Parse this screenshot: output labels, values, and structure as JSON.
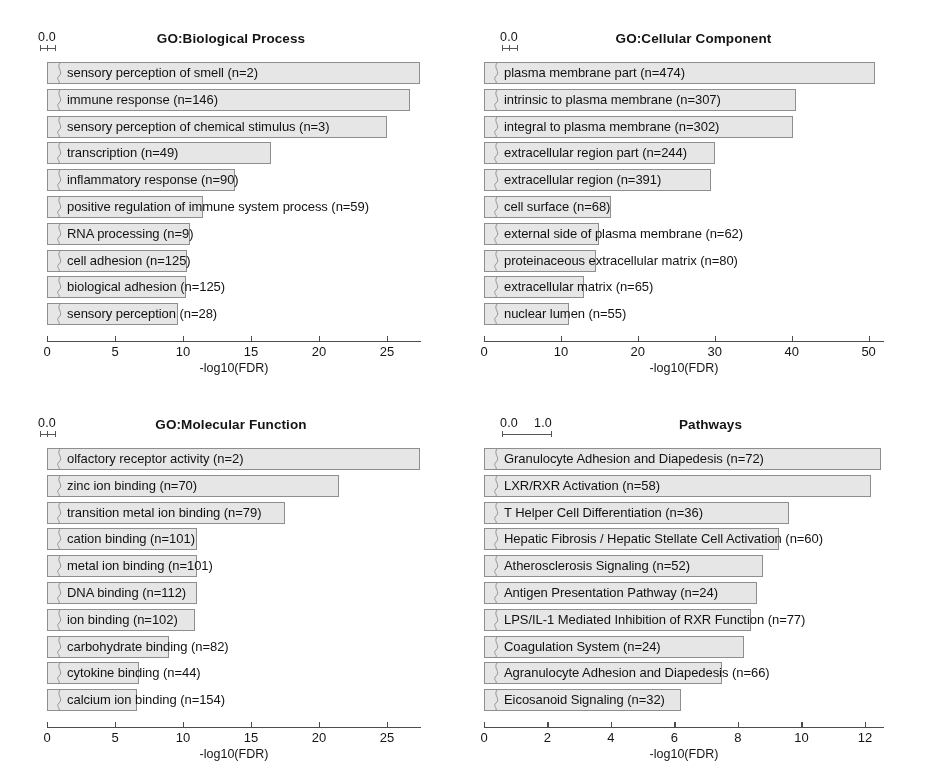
{
  "figure": {
    "background": "#ffffff",
    "bar_fill": "#e9e9e9",
    "bar_stroke": "#8e8e8e",
    "axis_color": "#4a4a4a"
  },
  "panels": [
    {
      "id": "go-biological-process",
      "title": "GO:Biological Process",
      "mini_scale": {
        "labels": [
          "0.0"
        ],
        "values": [
          0.0
        ]
      },
      "chart_data": {
        "type": "bar",
        "title": "GO:Biological Process",
        "xlabel": "-log10(FDR)",
        "ylabel": "",
        "orientation": "horizontal",
        "xlim": [
          0,
          27.5
        ],
        "ticks": [
          0,
          5,
          10,
          15,
          20,
          25
        ],
        "tick_labels": [
          "0",
          "5",
          "10",
          "15",
          "20",
          "25"
        ],
        "grid": false,
        "legend": "none",
        "categories": [
          "sensory perception of smell (n=2)",
          "immune response (n=146)",
          "sensory perception of chemical stimulus (n=3)",
          "transcription (n=49)",
          "inflammatory response (n=90)",
          "positive regulation of immune system process (n=59)",
          "RNA processing (n=9)",
          "cell adhesion (n=125)",
          "biological adhesion (n=125)",
          "sensory perception (n=28)"
        ],
        "values": [
          27.4,
          26.7,
          25.0,
          16.5,
          13.8,
          11.5,
          10.5,
          10.3,
          10.2,
          9.6
        ]
      }
    },
    {
      "id": "go-cellular-component",
      "title": "GO:Cellular Component",
      "mini_scale": {
        "labels": [
          "0.0"
        ],
        "values": [
          0.0
        ]
      },
      "chart_data": {
        "type": "bar",
        "title": "GO:Cellular Component",
        "xlabel": "-log10(FDR)",
        "ylabel": "",
        "orientation": "horizontal",
        "xlim": [
          0,
          52
        ],
        "ticks": [
          0,
          10,
          20,
          30,
          40,
          50
        ],
        "tick_labels": [
          "0",
          "10",
          "20",
          "30",
          "40",
          "50"
        ],
        "grid": false,
        "legend": "none",
        "categories": [
          "plasma membrane part (n=474)",
          "intrinsic to plasma membrane (n=307)",
          "integral to plasma membrane (n=302)",
          "extracellular region part (n=244)",
          "extracellular region (n=391)",
          "cell surface (n=68)",
          "external side of plasma membrane (n=62)",
          "proteinaceous extracellular matrix (n=80)",
          "extracellular matrix (n=65)",
          "nuclear lumen (n=55)"
        ],
        "values": [
          50.8,
          40.5,
          40.2,
          30.0,
          29.5,
          16.5,
          15.0,
          14.5,
          13.0,
          11.0
        ]
      }
    },
    {
      "id": "go-molecular-function",
      "title": "GO:Molecular Function",
      "mini_scale": {
        "labels": [
          "0.0"
        ],
        "values": [
          0.0
        ]
      },
      "chart_data": {
        "type": "bar",
        "title": "GO:Molecular Function",
        "xlabel": "-log10(FDR)",
        "ylabel": "",
        "orientation": "horizontal",
        "xlim": [
          0,
          27.5
        ],
        "ticks": [
          0,
          5,
          10,
          15,
          20,
          25
        ],
        "tick_labels": [
          "0",
          "5",
          "10",
          "15",
          "20",
          "25"
        ],
        "grid": false,
        "legend": "none",
        "categories": [
          "olfactory receptor activity (n=2)",
          "zinc ion binding (n=70)",
          "transition metal ion binding (n=79)",
          "cation binding (n=101)",
          "metal ion binding (n=101)",
          "DNA binding (n=112)",
          "ion binding (n=102)",
          "carbohydrate binding (n=82)",
          "cytokine binding (n=44)",
          "calcium ion binding (n=154)"
        ],
        "values": [
          27.4,
          21.5,
          17.5,
          11.0,
          11.0,
          11.0,
          10.9,
          9.0,
          6.8,
          6.6
        ]
      }
    },
    {
      "id": "pathways",
      "title": "Pathways",
      "mini_scale": {
        "labels": [
          "0.0",
          "1.0"
        ],
        "values": [
          0.0,
          1.0
        ]
      },
      "chart_data": {
        "type": "bar",
        "title": "Pathways",
        "xlabel": "-log10(FDR)",
        "ylabel": "",
        "orientation": "horizontal",
        "xlim": [
          0,
          12.6
        ],
        "ticks": [
          0,
          2,
          4,
          6,
          8,
          10,
          12
        ],
        "tick_labels": [
          "0",
          "2",
          "4",
          "6",
          "8",
          "10",
          "12"
        ],
        "grid": false,
        "legend": "none",
        "categories": [
          "Granulocyte Adhesion and Diapedesis (n=72)",
          "LXR/RXR Activation (n=58)",
          "T Helper Cell Differentiation (n=36)",
          "Hepatic Fibrosis / Hepatic Stellate Cell Activation (n=60)",
          "Atherosclerosis Signaling (n=52)",
          "Antigen Presentation Pathway (n=24)",
          "LPS/IL-1 Mediated Inhibition of RXR Function (n=77)",
          "Coagulation System (n=24)",
          "Agranulocyte Adhesion and Diapedesis (n=66)",
          "Eicosanoid Signaling (n=32)"
        ],
        "values": [
          12.5,
          12.2,
          9.6,
          9.3,
          8.8,
          8.6,
          8.4,
          8.2,
          7.5,
          6.2
        ]
      }
    }
  ]
}
